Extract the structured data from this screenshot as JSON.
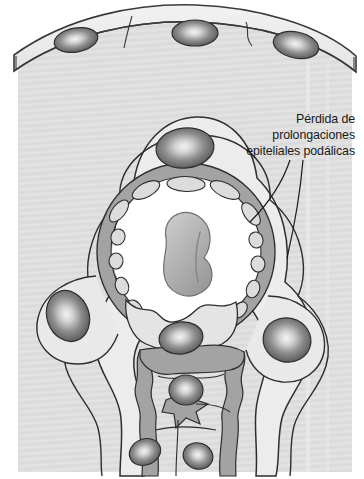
{
  "figure": {
    "language": "es",
    "canvas": {
      "width": 364,
      "height": 479
    },
    "background_color": "#ffffff"
  },
  "annotations": [
    {
      "name": "podocyte-foot-process-loss-label",
      "lines": [
        "Pérdida de",
        "prolongaciones",
        "epiteliales podálicas"
      ],
      "full_text": "Pérdida de prolongaciones epiteliales podálicas",
      "text_color": "#1a1a1a",
      "leader_lines": 2
    }
  ],
  "structures": [
    {
      "name": "parietal-epithelium-band",
      "label": "Parietal epithelium of Bowman's capsule",
      "fill": "#ededed",
      "stroke": "#4a4a4a"
    },
    {
      "name": "urinary-space",
      "label": "Urinary (Bowman's) space",
      "fill": "#dedede"
    },
    {
      "name": "capillary-lumen",
      "label": "Capillary lumen",
      "fill": "#ffffff"
    },
    {
      "name": "glomerular-basement-membrane",
      "label": "Glomerular basement membrane",
      "fill": "#a8a8a8"
    },
    {
      "name": "endothelial-fenestration",
      "label": "Fenestrated endothelium",
      "fill": "#d8d8d8"
    },
    {
      "name": "erythrocyte",
      "label": "Erythrocyte in lumen",
      "fill": "#b0b0b0"
    },
    {
      "name": "mesangial-matrix",
      "label": "Mesangial matrix",
      "fill": "#dcdcdc"
    },
    {
      "name": "podocyte-cell-body",
      "label": "Podocyte cell body",
      "fill": "#e6e6e6"
    }
  ],
  "cell_nuclei": [
    {
      "name": "parietal-epithelial-nucleus-left",
      "cx": 76,
      "cy": 40,
      "rx": 22,
      "ry": 12,
      "rotation": -10
    },
    {
      "name": "parietal-epithelial-nucleus-center",
      "cx": 195,
      "cy": 33,
      "rx": 23,
      "ry": 13,
      "rotation": 0
    },
    {
      "name": "parietal-epithelial-nucleus-right",
      "cx": 296,
      "cy": 45,
      "rx": 23,
      "ry": 13,
      "rotation": 12
    },
    {
      "name": "podocyte-nucleus-top",
      "cx": 185,
      "cy": 148,
      "rx": 29,
      "ry": 20,
      "rotation": -6
    },
    {
      "name": "podocyte-nucleus-left",
      "cx": 68,
      "cy": 316,
      "rx": 21,
      "ry": 26,
      "rotation": -20
    },
    {
      "name": "podocyte-nucleus-right",
      "cx": 287,
      "cy": 340,
      "rx": 24,
      "ry": 22,
      "rotation": 14
    },
    {
      "name": "mesangial-nucleus-upper",
      "cx": 181,
      "cy": 338,
      "rx": 22,
      "ry": 16,
      "rotation": -8
    },
    {
      "name": "mesangial-nucleus-middle",
      "cx": 186,
      "cy": 390,
      "rx": 17,
      "ry": 15,
      "rotation": 0
    },
    {
      "name": "mesangial-nucleus-lower-left",
      "cx": 145,
      "cy": 452,
      "rx": 16,
      "ry": 13,
      "rotation": -22
    },
    {
      "name": "mesangial-nucleus-lower-right",
      "cx": 198,
      "cy": 456,
      "rx": 15,
      "ry": 13,
      "rotation": 18
    }
  ],
  "colors": {
    "page_background": "#ffffff",
    "tissue_background": "#e0e0e0",
    "tissue_background_alt": "#d9d9d9",
    "membrane_gray": "#a8a8a8",
    "cytoplasm_light": "#ebebeb",
    "lumen_white": "#ffffff",
    "outline": "#2e2e2e",
    "nucleus_dark": "#4f4f4f",
    "nucleus_highlight": "#f2f2f2",
    "text": "#1a1a1a"
  }
}
